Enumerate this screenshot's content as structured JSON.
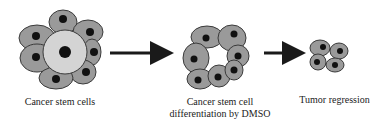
{
  "diagram": {
    "stages": [
      {
        "id": "stage-1",
        "label": "Cancer stem cells"
      },
      {
        "id": "stage-2",
        "label": "Cancer stem cell differentiation by DMSO"
      },
      {
        "id": "stage-3",
        "label": "Tumor regression"
      }
    ],
    "arrows": [
      {
        "from": "stage-1",
        "to": "stage-2"
      },
      {
        "from": "stage-2",
        "to": "stage-3"
      }
    ],
    "colors": {
      "cell_fill": "#9a9a9a",
      "stem_cell_fill": "#d4d4d4",
      "cell_outline": "#3a3a3a",
      "nucleus": "#111111",
      "arrow": "#1a1a1a",
      "text": "#222222"
    }
  }
}
